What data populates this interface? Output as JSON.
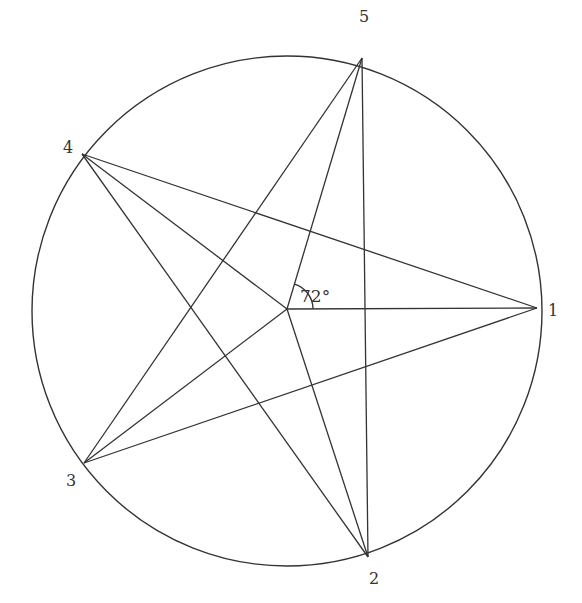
{
  "diagram": {
    "stroke_color": "#333333",
    "background": "#ffffff",
    "circle": {
      "cx": 287,
      "cy": 311,
      "r": 255
    },
    "center": {
      "x": 287,
      "y": 309
    },
    "points": [
      {
        "id": "1",
        "label": "1",
        "x": 537,
        "y": 308,
        "label_x": 556,
        "label_y": 316
      },
      {
        "id": "2",
        "label": "2",
        "x": 368,
        "y": 557,
        "label_x": 374,
        "label_y": 584
      },
      {
        "id": "3",
        "label": "3",
        "x": 84,
        "y": 463,
        "label_x": 71,
        "label_y": 486
      },
      {
        "id": "4",
        "label": "4",
        "x": 82,
        "y": 154,
        "label_x": 67,
        "label_y": 153
      },
      {
        "id": "5",
        "label": "5",
        "x": 362,
        "y": 58,
        "label_x": 364,
        "label_y": 22
      }
    ],
    "angle_annotation": {
      "label": "72°",
      "value_degrees": 72,
      "between": [
        "center-1",
        "center-5"
      ]
    }
  }
}
